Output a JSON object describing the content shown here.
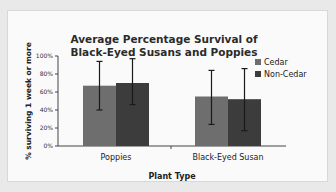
{
  "chart_data": {
    "type": "bar",
    "title": "Average Percentage Survival of Black-Eyed Susans and Poppies",
    "title_lines": [
      "Average Percentage Survival of",
      "Black-Eyed Susans and Poppies"
    ],
    "xlabel": "Plant Type",
    "ylabel": "% surviving 1 week or more",
    "categories": [
      "Poppies",
      "Black-Eyed Susan"
    ],
    "series": [
      {
        "name": "Cedar",
        "color": "#6e6e6e",
        "values": [
          67,
          55
        ],
        "error_low": [
          40,
          24
        ],
        "error_high": [
          94,
          84
        ]
      },
      {
        "name": "Non-Cedar",
        "color": "#3c3c3c",
        "values": [
          70,
          52
        ],
        "error_low": [
          46,
          17
        ],
        "error_high": [
          97,
          86
        ]
      }
    ],
    "ylim": [
      0,
      100
    ],
    "yticks": [
      "0%",
      "20%",
      "40%",
      "60%",
      "80%",
      "100%"
    ],
    "grid": false,
    "legend_position": "right"
  }
}
